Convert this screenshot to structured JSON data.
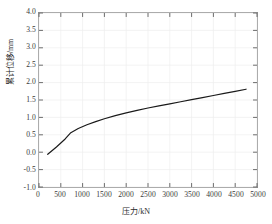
{
  "chart_data": {
    "type": "line",
    "title": "",
    "xlabel": "压力/kN",
    "ylabel": "累计位移/mm",
    "xlim": [
      0,
      5000
    ],
    "ylim": [
      -1.0,
      4.0
    ],
    "xticks": [
      0,
      500,
      1000,
      1500,
      2000,
      2500,
      3000,
      3500,
      4000,
      4500,
      5000
    ],
    "xtick_labels": [
      "0",
      "500",
      "1000",
      "1500",
      "2000",
      "2500",
      "3000",
      "3500",
      "4000",
      "4500",
      "5000"
    ],
    "yticks": [
      -1.0,
      -0.5,
      0.0,
      0.5,
      1.0,
      1.5,
      2.0,
      2.5,
      3.0,
      3.5,
      4.0
    ],
    "ytick_labels": [
      "-1.0",
      "-0.5",
      "0.0",
      "0.5",
      "1.0",
      "1.5",
      "2.0",
      "2.5",
      "3.0",
      "3.5",
      "4.0"
    ],
    "grid": true,
    "grid_color": "#ededed",
    "legend": "none",
    "line_color": "#1a1a1a",
    "line_width": 1.2,
    "series": [
      {
        "name": "累计位移",
        "x": [
          200,
          400,
          600,
          730,
          900,
          1100,
          1300,
          1500,
          1750,
          2000,
          2250,
          2500,
          2750,
          3000,
          3250,
          3500,
          3750,
          4000,
          4250,
          4500,
          4750
        ],
        "y": [
          -0.06,
          0.15,
          0.38,
          0.56,
          0.68,
          0.79,
          0.88,
          0.96,
          1.05,
          1.13,
          1.2,
          1.27,
          1.33,
          1.39,
          1.45,
          1.51,
          1.57,
          1.63,
          1.69,
          1.75,
          1.81
        ]
      }
    ]
  }
}
